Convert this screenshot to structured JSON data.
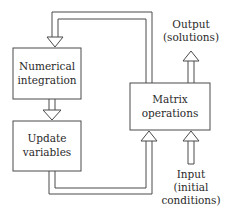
{
  "diagram": {
    "nodes": [
      {
        "id": "numerical_integration",
        "lines": [
          "Numerical",
          "integration"
        ]
      },
      {
        "id": "update_variables",
        "lines": [
          "Update",
          "variables"
        ]
      },
      {
        "id": "matrix_operations",
        "lines": [
          "Matrix",
          "operations"
        ]
      }
    ],
    "output": {
      "lines": [
        "Output",
        "(solutions)"
      ]
    },
    "input": {
      "lines": [
        "Input",
        "(initial",
        "conditions)"
      ]
    },
    "edges": [
      {
        "from": "matrix_operations",
        "to": "numerical_integration"
      },
      {
        "from": "numerical_integration",
        "to": "update_variables"
      },
      {
        "from": "update_variables",
        "to": "matrix_operations"
      },
      {
        "from": "matrix_operations",
        "to": "output"
      },
      {
        "from": "input",
        "to": "matrix_operations"
      }
    ]
  }
}
